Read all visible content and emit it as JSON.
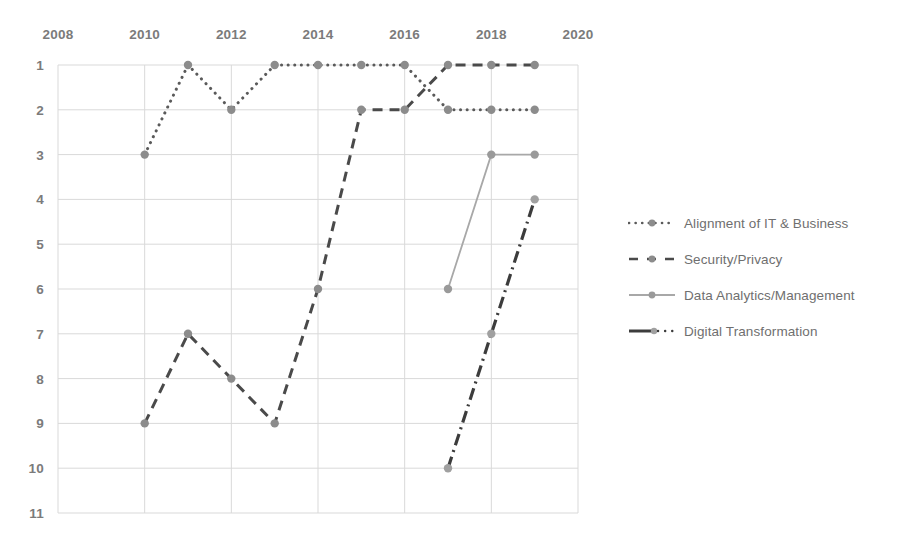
{
  "chart_data": {
    "type": "line",
    "title": "",
    "xlabel": "",
    "ylabel": "",
    "x": [
      2010,
      2011,
      2012,
      2013,
      2014,
      2015,
      2016,
      2017,
      2018,
      2019
    ],
    "xlim": [
      2008,
      2020
    ],
    "ylim": [
      1,
      11
    ],
    "y_axis_inverted": true,
    "grid": true,
    "legend_position": "right",
    "x_tick_labels": [
      "2008",
      "2010",
      "2012",
      "2014",
      "2016",
      "2018",
      "2020"
    ],
    "x_tick_values": [
      2008,
      2010,
      2012,
      2014,
      2016,
      2018,
      2020
    ],
    "y_tick_labels": [
      "1",
      "2",
      "3",
      "4",
      "5",
      "6",
      "7",
      "8",
      "9",
      "10",
      "11"
    ],
    "y_tick_values": [
      1,
      2,
      3,
      4,
      5,
      6,
      7,
      8,
      9,
      10,
      11
    ],
    "series": [
      {
        "name": "Alignment of IT & Business",
        "style": "dotted",
        "color": "#5a5a5a",
        "marker_color": "#8c8c8c",
        "points": [
          {
            "x": 2010,
            "y": 3
          },
          {
            "x": 2011,
            "y": 1
          },
          {
            "x": 2012,
            "y": 2
          },
          {
            "x": 2013,
            "y": 1
          },
          {
            "x": 2014,
            "y": 1
          },
          {
            "x": 2015,
            "y": 1
          },
          {
            "x": 2016,
            "y": 1
          },
          {
            "x": 2017,
            "y": 2
          },
          {
            "x": 2018,
            "y": 2
          },
          {
            "x": 2019,
            "y": 2
          }
        ]
      },
      {
        "name": "Security/Privacy",
        "style": "dashed",
        "color": "#4a4a4a",
        "marker_color": "#8c8c8c",
        "points": [
          {
            "x": 2010,
            "y": 9
          },
          {
            "x": 2011,
            "y": 7
          },
          {
            "x": 2012,
            "y": 8
          },
          {
            "x": 2013,
            "y": 9
          },
          {
            "x": 2014,
            "y": 6
          },
          {
            "x": 2015,
            "y": 2
          },
          {
            "x": 2016,
            "y": 2
          },
          {
            "x": 2017,
            "y": 1
          },
          {
            "x": 2018,
            "y": 1
          },
          {
            "x": 2019,
            "y": 1
          }
        ]
      },
      {
        "name": "Data Analytics/Management",
        "style": "solid",
        "color": "#a8a8a8",
        "marker_color": "#9a9a9a",
        "points": [
          {
            "x": 2017,
            "y": 6
          },
          {
            "x": 2018,
            "y": 3
          },
          {
            "x": 2019,
            "y": 3
          }
        ]
      },
      {
        "name": "Digital Transformation",
        "style": "dashdot",
        "color": "#3c3c3c",
        "marker_color": "#a0a0a0",
        "points": [
          {
            "x": 2017,
            "y": 10
          },
          {
            "x": 2018,
            "y": 7
          },
          {
            "x": 2019,
            "y": 4
          }
        ]
      }
    ]
  },
  "legend": {
    "items": [
      {
        "label": "Alignment of IT & Business"
      },
      {
        "label": "Security/Privacy"
      },
      {
        "label": "Data Analytics/Management"
      },
      {
        "label": "Digital Transformation"
      }
    ]
  }
}
